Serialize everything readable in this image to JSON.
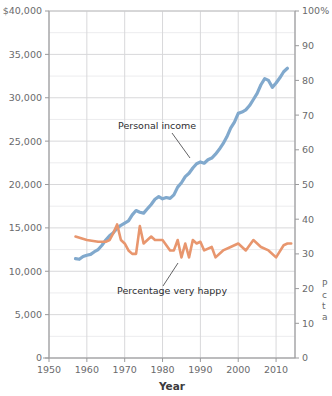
{
  "chart_data": {
    "type": "line",
    "title": "",
    "xlabel": "Year",
    "ylabel_left": "",
    "ylabel_right": "",
    "xlim": [
      1950,
      2015
    ],
    "xticks": [
      1950,
      1960,
      1970,
      1980,
      1990,
      2000,
      2010
    ],
    "xtick_labels": [
      "1950",
      "1960",
      "1970",
      "1980",
      "1990",
      "2000",
      "2010"
    ],
    "ylim_left": [
      0,
      40000
    ],
    "yticks_left": [
      0,
      5000,
      10000,
      15000,
      20000,
      25000,
      30000,
      35000,
      40000
    ],
    "ytick_labels_left": [
      "0",
      "5,000",
      "10,000",
      "15,000",
      "20,000",
      "25,000",
      "30,000",
      "35,000",
      "$40,000"
    ],
    "ylim_right": [
      0,
      100
    ],
    "yticks_right": [
      0,
      10,
      20,
      30,
      40,
      50,
      60,
      70,
      80,
      90,
      100
    ],
    "ytick_labels_right": [
      "0",
      "10",
      "20",
      "30",
      "40",
      "50",
      "60",
      "70",
      "80",
      "90",
      "100%"
    ],
    "grid": true,
    "legend": "inline-annotations",
    "series": [
      {
        "name": "Personal income",
        "axis": "left",
        "color": "#81a9cd",
        "label_x": 1977,
        "label_y": 27600,
        "x": [
          1957,
          1958,
          1959,
          1960,
          1961,
          1962,
          1963,
          1964,
          1965,
          1966,
          1967,
          1968,
          1969,
          1970,
          1971,
          1972,
          1973,
          1974,
          1975,
          1976,
          1977,
          1978,
          1979,
          1980,
          1981,
          1982,
          1983,
          1984,
          1985,
          1986,
          1987,
          1988,
          1989,
          1990,
          1991,
          1992,
          1993,
          1994,
          1995,
          1996,
          1997,
          1998,
          1999,
          2000,
          2001,
          2002,
          2003,
          2004,
          2005,
          2006,
          2007,
          2008,
          2009,
          2010,
          2011,
          2012,
          2013
        ],
        "values": [
          11450,
          11380,
          11700,
          11850,
          11950,
          12250,
          12500,
          13000,
          13600,
          14100,
          14450,
          14950,
          15300,
          15550,
          15800,
          16500,
          17000,
          16800,
          16700,
          17200,
          17700,
          18300,
          18600,
          18350,
          18500,
          18400,
          18800,
          19700,
          20200,
          20900,
          21300,
          21900,
          22400,
          22600,
          22450,
          22850,
          23050,
          23500,
          24050,
          24700,
          25500,
          26500,
          27200,
          28200,
          28350,
          28600,
          29100,
          29800,
          30500,
          31500,
          32200,
          32000,
          31200,
          31700,
          32300,
          33000,
          33400
        ]
      },
      {
        "name": "Percentage very happy",
        "axis": "right",
        "color": "#e8966e",
        "label_x": 1988,
        "label_y_pct": 21,
        "x": [
          1957,
          1960,
          1963,
          1965,
          1966,
          1967,
          1968,
          1969,
          1970,
          1971,
          1972,
          1973,
          1974,
          1975,
          1976,
          1977,
          1978,
          1980,
          1982,
          1983,
          1984,
          1985,
          1986,
          1987,
          1988,
          1989,
          1990,
          1991,
          1993,
          1994,
          1996,
          1998,
          2000,
          2002,
          2004,
          2006,
          2008,
          2010,
          2012,
          2013,
          2014
        ],
        "values_pct": [
          35,
          34,
          33.5,
          33.5,
          34,
          36,
          38.5,
          34,
          33,
          31,
          30,
          30,
          38,
          33,
          34,
          35,
          34,
          34,
          31,
          31,
          34,
          29,
          33,
          29,
          34,
          33,
          33.5,
          31,
          32,
          29,
          31,
          32,
          33,
          31,
          34,
          32,
          31,
          29,
          32.5,
          33,
          33
        ]
      }
    ],
    "annotations": [
      {
        "text": "Personal income",
        "kind": "series-label"
      },
      {
        "text": "Percentage very happy",
        "kind": "series-label"
      }
    ]
  },
  "side_note": {
    "line1": "P",
    "line2": "c",
    "line3": "t",
    "line4": "a"
  }
}
